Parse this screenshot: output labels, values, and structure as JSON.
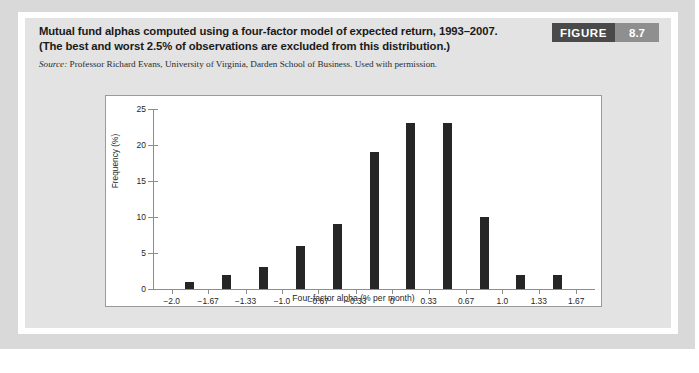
{
  "figure": {
    "badge_label": "FIGURE",
    "badge_number": "8.7",
    "caption_line_1": "Mutual fund alphas computed using a four-factor model of expected return, 1993–2007.",
    "caption_line_2": "(The best and worst 2.5% of observations are excluded from this distribution.)",
    "source_label": "Source:",
    "source_text": "Professor Richard Evans, University of Virginia, Darden School of Business. Used with permission.",
    "colors": {
      "badge_word_bg": "#4a4a4a",
      "badge_num_bg": "#8f8f8f",
      "panel_bg": "#e3e3e3",
      "bar_color": "#262626",
      "axis_color": "#8d8d8d"
    }
  },
  "chart_data": {
    "type": "bar",
    "title": "",
    "xlabel": "Four-factor alpha (% per month)",
    "ylabel": "Frequency (%)",
    "categories": [
      "-1.835",
      "-1.5",
      "-1.165",
      "-0.835",
      "-0.5",
      "-0.165",
      "0.165",
      "0.5",
      "0.835",
      "1.165",
      "1.5",
      "1.835"
    ],
    "values": [
      1,
      2,
      3,
      6,
      9,
      19,
      23,
      23,
      10,
      2,
      2,
      0
    ],
    "xtick_labels": [
      "−2.0",
      "−1.67",
      "−1.33",
      "−1.0",
      "−0.67",
      "−0.33",
      "0",
      "0.33",
      "0.67",
      "1.0",
      "1.33",
      "1.67"
    ],
    "xtick_values": [
      -2.0,
      -1.67,
      -1.33,
      -1.0,
      -0.67,
      -0.33,
      0,
      0.33,
      0.67,
      1.0,
      1.33,
      1.67
    ],
    "ytick_labels": [
      "0",
      "5",
      "10",
      "15",
      "20",
      "25"
    ],
    "ytick_values": [
      0,
      5,
      10,
      15,
      20,
      25
    ],
    "ylim": [
      0,
      25
    ],
    "xlim": [
      -2.17,
      1.84
    ],
    "grid": false,
    "legend": null
  }
}
